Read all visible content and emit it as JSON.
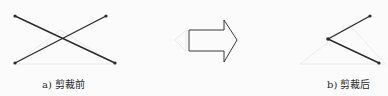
{
  "diagram": {
    "before": {
      "label": "a) 剪裁前",
      "lines": [
        {
          "x1": 15,
          "y1": 16,
          "x2": 115,
          "y2": 63
        },
        {
          "x1": 15,
          "y1": 63,
          "x2": 106,
          "y2": 16
        }
      ]
    },
    "arrow": {
      "direction": "right",
      "style": "outline"
    },
    "after": {
      "label": "b) 剪裁后",
      "lines": [
        {
          "x1": 328,
          "y1": 39,
          "x2": 370,
          "y2": 16
        },
        {
          "x1": 328,
          "y1": 39,
          "x2": 379,
          "y2": 63
        }
      ]
    },
    "colors": {
      "line": "#2b2b2b",
      "arrow": "#3a3a3a",
      "background": "#fbfbfb"
    }
  }
}
